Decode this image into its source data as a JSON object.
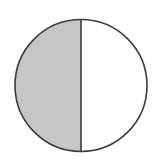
{
  "diagram": {
    "type": "fraction-circle",
    "parts_total": 2,
    "parts_shaded": 1,
    "fraction": "1/2",
    "shaded_side": "left",
    "colors": {
      "shaded_fill": "#c6c6c6",
      "unshaded_fill": "#ffffff",
      "stroke": "#3c3c3c",
      "background": "#ffffff"
    },
    "geometry": {
      "cx": 81,
      "cy": 85.5,
      "r": 66,
      "stroke_width": 1.6
    }
  }
}
